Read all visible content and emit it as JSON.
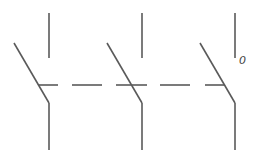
{
  "diagram": {
    "type": "three-pole switch schematic symbol",
    "poles": [
      {
        "id": "pole-1",
        "x": 49
      },
      {
        "id": "pole-2",
        "x": 142
      },
      {
        "id": "pole-3",
        "x": 235
      }
    ],
    "linkage": "dashed mechanical link",
    "label": "0",
    "stroke_color": "#5a5a5a"
  }
}
